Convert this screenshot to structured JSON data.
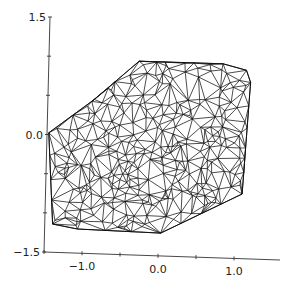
{
  "chart_data": {
    "type": "scatter",
    "title": "",
    "subtitle": "Delaunay triangulation mesh of scattered points",
    "xlabel": "",
    "ylabel": "",
    "xlim": [
      -1.5,
      1.0
    ],
    "ylim": [
      -1.5,
      1.5
    ],
    "x_ticks": [
      -1.5,
      -1.0,
      -0.5,
      0.0,
      0.5,
      1.0
    ],
    "x_tick_labels": [
      {
        "value": -1.0,
        "label": "−1.0"
      },
      {
        "value": 0.0,
        "label": "0.0"
      },
      {
        "value": 1.0,
        "label": "1.0"
      }
    ],
    "y_ticks": [
      -1.5,
      -1.0,
      -0.5,
      0.0,
      0.5,
      1.0,
      1.5
    ],
    "y_tick_labels": [
      {
        "value": 1.5,
        "label": "1.5"
      },
      {
        "value": 0.0,
        "label": "0.0"
      },
      {
        "value": -1.5,
        "label": "−1.5"
      }
    ],
    "grid": false,
    "legend": null,
    "line_color": "#111111",
    "hull": [
      [
        -0.72,
        0.92
      ],
      [
        0.4,
        0.93
      ],
      [
        0.71,
        0.86
      ],
      [
        0.76,
        0.71
      ],
      [
        0.61,
        -0.69
      ],
      [
        -0.49,
        -1.22
      ],
      [
        -1.6,
        -1.21
      ],
      [
        -1.93,
        -1.16
      ],
      [
        -1.95,
        -0.02
      ],
      [
        -1.33,
        0.42
      ]
    ],
    "interior_points_count": 320,
    "interior_points_seed": 17
  }
}
